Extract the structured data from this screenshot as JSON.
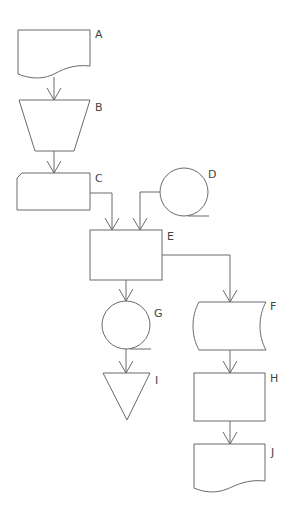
{
  "diagram": {
    "type": "flowchart",
    "nodes": [
      {
        "id": "A",
        "label": "A",
        "shape": "document"
      },
      {
        "id": "B",
        "label": "B",
        "shape": "manual-operation"
      },
      {
        "id": "C",
        "label": "C",
        "shape": "card"
      },
      {
        "id": "D",
        "label": "D",
        "shape": "magnetic-tape"
      },
      {
        "id": "E",
        "label": "E",
        "shape": "process"
      },
      {
        "id": "F",
        "label": "F",
        "shape": "stored-data"
      },
      {
        "id": "G",
        "label": "G",
        "shape": "magnetic-tape"
      },
      {
        "id": "H",
        "label": "H",
        "shape": "process"
      },
      {
        "id": "I",
        "label": "I",
        "shape": "merge"
      },
      {
        "id": "J",
        "label": "J",
        "shape": "document"
      }
    ],
    "edges": [
      {
        "from": "A",
        "to": "B"
      },
      {
        "from": "B",
        "to": "C"
      },
      {
        "from": "C",
        "to": "E"
      },
      {
        "from": "D",
        "to": "E"
      },
      {
        "from": "E",
        "to": "G"
      },
      {
        "from": "E",
        "to": "F"
      },
      {
        "from": "G",
        "to": "I"
      },
      {
        "from": "F",
        "to": "H"
      },
      {
        "from": "H",
        "to": "J"
      }
    ],
    "colors": {
      "stroke": "#6a6a6a",
      "text": "#444444",
      "background": "#ffffff"
    }
  }
}
